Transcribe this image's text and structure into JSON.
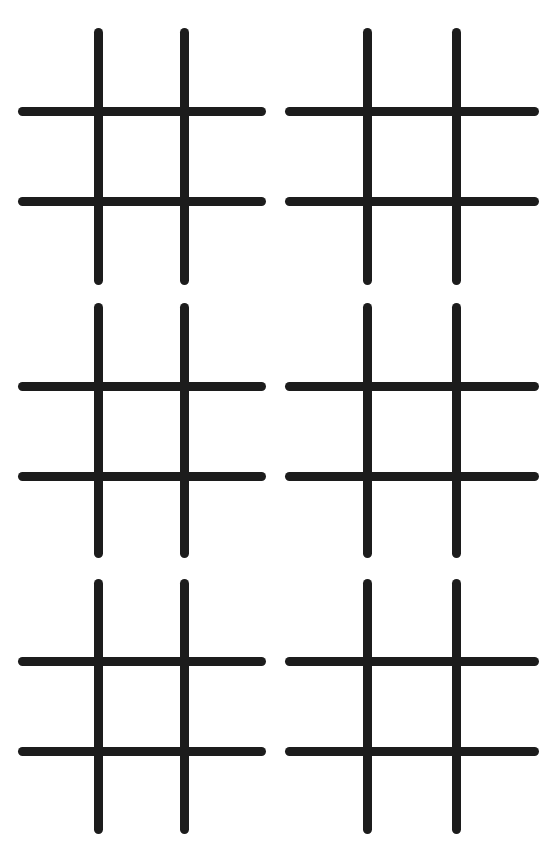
{
  "page": {
    "background": "#ffffff",
    "line_color": "#1c1c1c",
    "stroke_width": 9
  },
  "boards": [
    {
      "id": "board-1",
      "row": 1,
      "col": 1,
      "v_x": [
        98,
        184
      ],
      "h_y": [
        111,
        201
      ],
      "x_range": [
        18,
        266
      ],
      "y_range": [
        28,
        285
      ],
      "cells": [
        "",
        "",
        "",
        "",
        "",
        "",
        "",
        "",
        ""
      ]
    },
    {
      "id": "board-2",
      "row": 1,
      "col": 2,
      "v_x": [
        367,
        456
      ],
      "h_y": [
        111,
        201
      ],
      "x_range": [
        285,
        539
      ],
      "y_range": [
        28,
        285
      ],
      "cells": [
        "",
        "",
        "",
        "",
        "",
        "",
        "",
        "",
        ""
      ]
    },
    {
      "id": "board-3",
      "row": 2,
      "col": 1,
      "v_x": [
        98,
        184
      ],
      "h_y": [
        386,
        476
      ],
      "x_range": [
        18,
        266
      ],
      "y_range": [
        303,
        558
      ],
      "cells": [
        "",
        "",
        "",
        "",
        "",
        "",
        "",
        "",
        ""
      ]
    },
    {
      "id": "board-4",
      "row": 2,
      "col": 2,
      "v_x": [
        367,
        456
      ],
      "h_y": [
        386,
        476
      ],
      "x_range": [
        285,
        539
      ],
      "y_range": [
        303,
        558
      ],
      "cells": [
        "",
        "",
        "",
        "",
        "",
        "",
        "",
        "",
        ""
      ]
    },
    {
      "id": "board-5",
      "row": 3,
      "col": 1,
      "v_x": [
        98,
        184
      ],
      "h_y": [
        661,
        751
      ],
      "x_range": [
        18,
        266
      ],
      "y_range": [
        579,
        834
      ],
      "cells": [
        "",
        "",
        "",
        "",
        "",
        "",
        "",
        "",
        ""
      ]
    },
    {
      "id": "board-6",
      "row": 3,
      "col": 2,
      "v_x": [
        367,
        456
      ],
      "h_y": [
        661,
        751
      ],
      "x_range": [
        285,
        539
      ],
      "y_range": [
        579,
        834
      ],
      "cells": [
        "",
        "",
        "",
        "",
        "",
        "",
        "",
        "",
        ""
      ]
    }
  ]
}
